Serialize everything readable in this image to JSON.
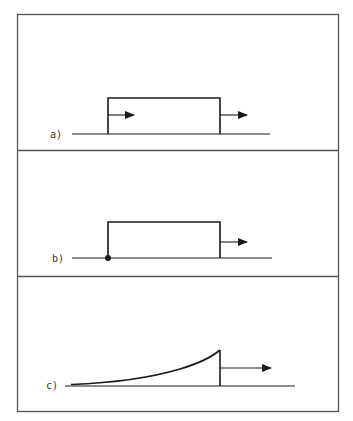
{
  "figure": {
    "frame_color": "#555555",
    "line_color": "#1a1a1a",
    "panels": [
      {
        "id": "a",
        "label": "a)",
        "description": "Rectangular pulse with arrows at rising and falling edges"
      },
      {
        "id": "b",
        "label": "b)",
        "description": "Rectangular pulse with dot at rising edge and arrow at falling edge"
      },
      {
        "id": "c",
        "label": "c)",
        "description": "Exponentially rising curve with sharp cutoff and arrow"
      }
    ]
  }
}
